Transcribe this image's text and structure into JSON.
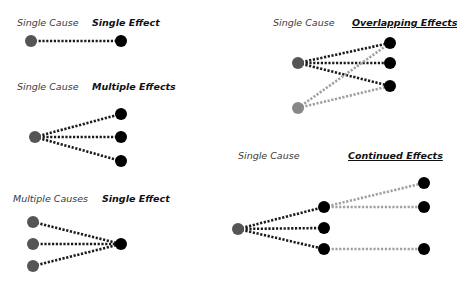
{
  "colors": {
    "cause": "#555555",
    "cause_light": "#888888",
    "effect": "#000000",
    "line_dark": "#1a1a1a",
    "line_light": "#a0a0a0"
  },
  "panels": [
    {
      "id": "single-single",
      "cause_label": "Single Cause",
      "effect_label": "Single Effect"
    },
    {
      "id": "single-multiple",
      "cause_label": "Single Cause",
      "effect_label": "Multiple Effects"
    },
    {
      "id": "multiple-single",
      "cause_label": "Multiple Causes",
      "effect_label": "Single Effect"
    },
    {
      "id": "overlapping",
      "cause_label": "Single Cause",
      "effect_label": "Overlapping Effects"
    },
    {
      "id": "continued",
      "cause_label": "Single Cause",
      "effect_label": "Continued Effects"
    }
  ]
}
